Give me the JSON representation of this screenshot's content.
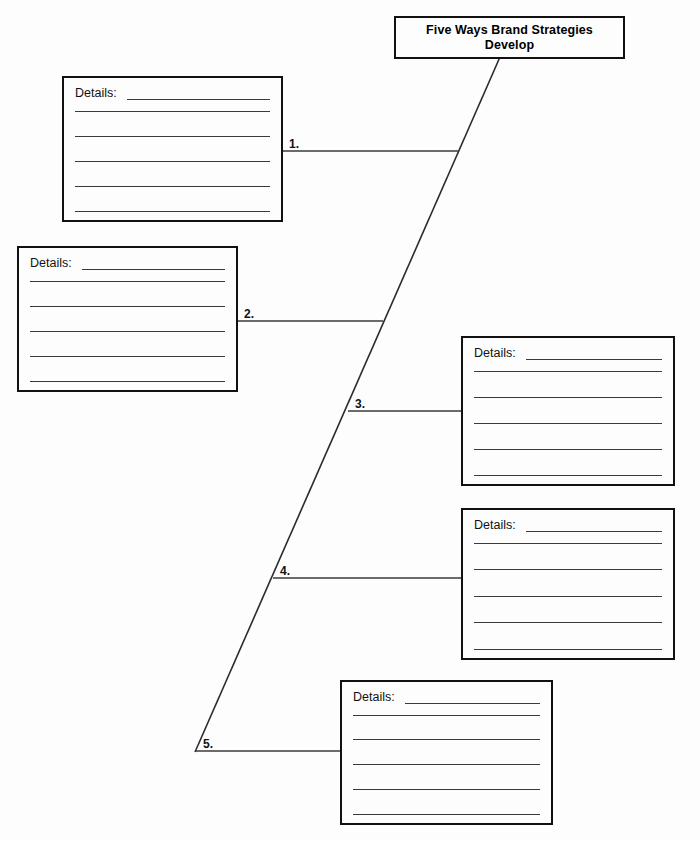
{
  "page": {
    "background_color": "#fdfdfd",
    "ink_color": "#111111",
    "rule_color": "#3a3a3a",
    "width": 700,
    "height": 841
  },
  "title_box": {
    "text": "Five Ways Brand Strategies Develop"
  },
  "branches": [
    {
      "number": "1."
    },
    {
      "number": "2."
    },
    {
      "number": "3."
    },
    {
      "number": "4."
    },
    {
      "number": "5."
    }
  ],
  "detail_boxes": [
    {
      "label": "Details:",
      "blank_lines": [
        "",
        "",
        "",
        "",
        ""
      ]
    },
    {
      "label": "Details:",
      "blank_lines": [
        "",
        "",
        "",
        "",
        ""
      ]
    },
    {
      "label": "Details:",
      "blank_lines": [
        "",
        "",
        "",
        "",
        ""
      ]
    },
    {
      "label": "Details:",
      "blank_lines": [
        "",
        "",
        "",
        "",
        ""
      ]
    },
    {
      "label": "Details:",
      "blank_lines": [
        "",
        "",
        "",
        "",
        ""
      ]
    }
  ]
}
